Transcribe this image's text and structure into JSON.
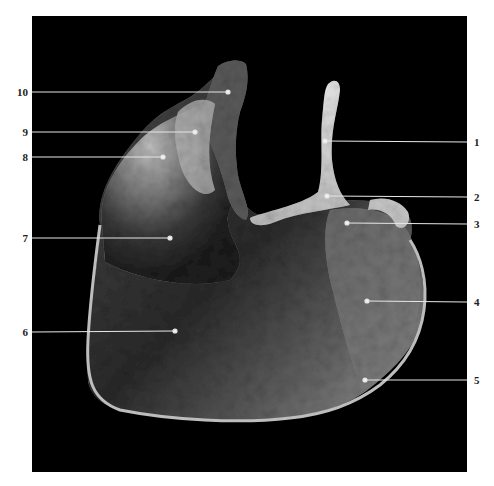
{
  "figure": {
    "background_color": "#ffffff",
    "panel_color": "#000000",
    "label_color": "#222222",
    "leader_color": "#e6e6e6",
    "caption": ""
  },
  "labels": [
    {
      "id": "1",
      "text": "1",
      "side": "right",
      "y": 142,
      "end": [
        325,
        141
      ]
    },
    {
      "id": "2",
      "text": "2",
      "side": "right",
      "y": 197,
      "end": [
        327,
        196
      ]
    },
    {
      "id": "3",
      "text": "3",
      "side": "right",
      "y": 224,
      "end": [
        347,
        223
      ]
    },
    {
      "id": "4",
      "text": "4",
      "side": "right",
      "y": 302,
      "end": [
        367,
        301
      ]
    },
    {
      "id": "5",
      "text": "5",
      "side": "right",
      "y": 380,
      "end": [
        365,
        380
      ]
    },
    {
      "id": "6",
      "text": "6",
      "side": "left",
      "y": 332,
      "end": [
        175,
        331
      ]
    },
    {
      "id": "7",
      "text": "7",
      "side": "left",
      "y": 238,
      "end": [
        170,
        238
      ]
    },
    {
      "id": "8",
      "text": "8",
      "side": "left",
      "y": 157,
      "end": [
        163,
        157
      ]
    },
    {
      "id": "9",
      "text": "9",
      "side": "left",
      "y": 132,
      "end": [
        195,
        132
      ]
    },
    {
      "id": "10",
      "text": "10",
      "side": "left",
      "y": 92,
      "end": [
        228,
        92
      ]
    }
  ]
}
